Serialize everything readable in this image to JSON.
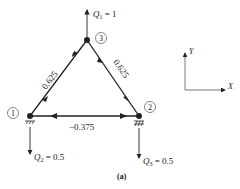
{
  "figure": {
    "caption": "(a)",
    "nodes": [
      {
        "id": "1",
        "label": "1",
        "x": 30,
        "y": 116
      },
      {
        "id": "2",
        "label": "2",
        "x": 139,
        "y": 116
      },
      {
        "id": "3",
        "label": "3",
        "x": 87,
        "y": 40
      }
    ],
    "members": [
      {
        "from": "1",
        "to": "3",
        "force": "0.625"
      },
      {
        "from": "3",
        "to": "2",
        "force": "0.625"
      },
      {
        "from": "1",
        "to": "2",
        "force": "−0.375"
      }
    ],
    "loads": [
      {
        "node": "3",
        "name": "Q",
        "sub": "1",
        "value": " = 1",
        "direction": "up"
      },
      {
        "node": "1",
        "name": "Q",
        "sub": "2",
        "value": " = 0.5",
        "direction": "down"
      },
      {
        "node": "2",
        "name": "Q",
        "sub": "3",
        "value": " = 0.5",
        "direction": "down"
      }
    ],
    "axes": {
      "x_label": "X",
      "y_label": "Y"
    },
    "colors": {
      "line": "#222222"
    }
  }
}
